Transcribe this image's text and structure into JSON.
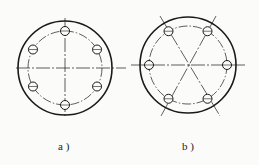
{
  "figures": [
    {
      "id": "a",
      "label": "a )",
      "center": [
        65,
        68
      ],
      "outer_radius": 47,
      "pitch_radius": 37,
      "hole_radius": 4.5,
      "holes": 6,
      "hole_start_angle_deg": 90,
      "centerlines": "horizontal-vertical"
    },
    {
      "id": "b",
      "label": "b )",
      "center": [
        188,
        65
      ],
      "outer_radius": 48,
      "pitch_radius": 39,
      "hole_radius": 4.5,
      "holes": 6,
      "hole_start_angle_deg": 0,
      "centerlines": "three-diameters-at-60deg"
    }
  ],
  "colors": {
    "line": "#1a1a1a",
    "background": "#fbfbf9"
  }
}
